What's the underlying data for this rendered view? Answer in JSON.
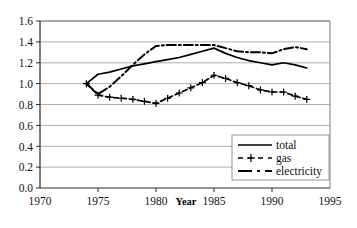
{
  "chart_data": {
    "type": "line",
    "title": "",
    "subtitle": "",
    "xlabel": "Year",
    "ylabel": "",
    "xlim": [
      1970,
      1995
    ],
    "ylim": [
      0.0,
      1.6
    ],
    "grid": true,
    "grid_axis": "y",
    "legend_position": "bottom-right",
    "xticks": [
      1970,
      1975,
      1980,
      1985,
      1990,
      1995
    ],
    "xtick_labels": [
      "1970",
      "1975",
      "1980",
      "1985",
      "1990",
      "1995"
    ],
    "yticks": [
      0.0,
      0.2,
      0.4,
      0.6,
      0.8,
      1.0,
      1.2,
      1.4,
      1.6
    ],
    "ytick_labels": [
      "0.0",
      "0.2",
      "0.4",
      "0.6",
      "0.8",
      "1.0",
      "1.2",
      "1.4",
      "1.6"
    ],
    "series": [
      {
        "name": "total",
        "style": "solid",
        "marker": "none",
        "color": "#000000",
        "x": [
          1974,
          1975,
          1976,
          1977,
          1978,
          1979,
          1980,
          1981,
          1982,
          1983,
          1984,
          1985,
          1986,
          1987,
          1988,
          1989,
          1990,
          1991,
          1992,
          1993
        ],
        "values": [
          1.0,
          1.09,
          1.11,
          1.14,
          1.17,
          1.19,
          1.21,
          1.23,
          1.25,
          1.28,
          1.31,
          1.34,
          1.29,
          1.25,
          1.22,
          1.2,
          1.18,
          1.2,
          1.18,
          1.15
        ]
      },
      {
        "name": "gas",
        "style": "dashed",
        "marker": "plus",
        "color": "#000000",
        "x": [
          1974,
          1975,
          1976,
          1977,
          1978,
          1979,
          1980,
          1981,
          1982,
          1983,
          1984,
          1985,
          1986,
          1987,
          1988,
          1989,
          1990,
          1991,
          1992,
          1993
        ],
        "values": [
          1.0,
          0.89,
          0.87,
          0.86,
          0.85,
          0.83,
          0.81,
          0.86,
          0.91,
          0.96,
          1.01,
          1.08,
          1.05,
          1.01,
          0.98,
          0.94,
          0.92,
          0.92,
          0.88,
          0.85
        ]
      },
      {
        "name": "electricity",
        "style": "dash-dot",
        "marker": "none",
        "color": "#000000",
        "x": [
          1974,
          1975,
          1976,
          1977,
          1978,
          1979,
          1980,
          1981,
          1982,
          1983,
          1984,
          1985,
          1986,
          1987,
          1988,
          1989,
          1990,
          1991,
          1992,
          1993
        ],
        "values": [
          1.0,
          0.9,
          0.97,
          1.07,
          1.18,
          1.28,
          1.36,
          1.37,
          1.37,
          1.37,
          1.37,
          1.37,
          1.34,
          1.31,
          1.3,
          1.3,
          1.29,
          1.33,
          1.35,
          1.33
        ]
      }
    ]
  },
  "legend": {
    "entries": [
      {
        "label": "total"
      },
      {
        "label": "gas"
      },
      {
        "label": "electricity"
      }
    ]
  },
  "colors": {
    "ink": "#000000",
    "grid": "#9a9a9a",
    "frame": "#7a7a7a",
    "background": "#ffffff"
  }
}
